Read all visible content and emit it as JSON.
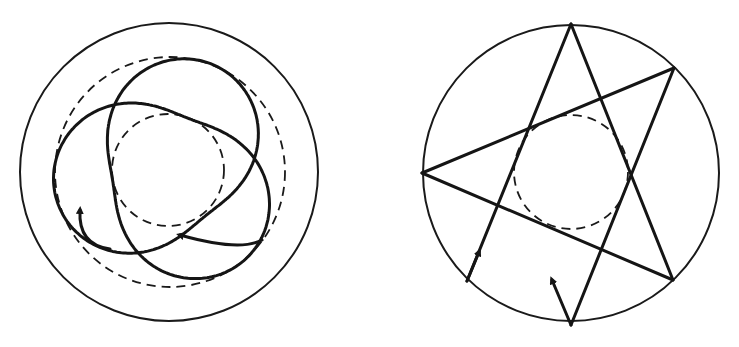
{
  "figure": {
    "panels": [
      {
        "id": "left",
        "description": "Rosette orbit (precessing ellipse) between two dashed circles inside an outer circle",
        "outer_circle": "solid",
        "bounding_circles": [
          "dashed-outer",
          "dashed-inner"
        ],
        "orbit_lobes": 3,
        "arrows": 2
      },
      {
        "id": "right",
        "description": "Straight-line star path (pentagram-like) reflecting off outer circle, tangent to inner dashed circle",
        "outer_circle": "solid",
        "bounding_circles": [
          "dashed-inner"
        ],
        "vertices": 5,
        "arrows": 2
      }
    ],
    "colors": {
      "ink": "#151515",
      "background": "#ffffff"
    }
  }
}
